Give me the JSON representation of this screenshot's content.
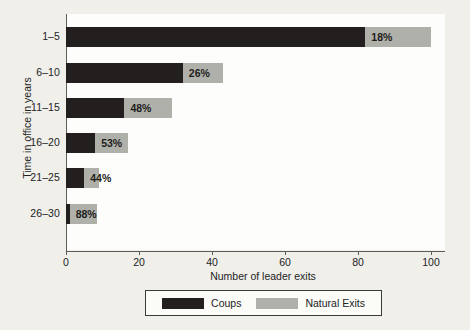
{
  "chart_data": {
    "type": "bar",
    "orientation": "horizontal",
    "stacked": true,
    "title": "",
    "xlabel": "Number of leader exits",
    "ylabel": "Time in office in years",
    "categories": [
      "1–5",
      "6–10",
      "11–15",
      "16–20",
      "21–25",
      "26–30"
    ],
    "series": [
      {
        "name": "Coups",
        "color": "#221f1e",
        "values": [
          82,
          32,
          16,
          8,
          5,
          1
        ]
      },
      {
        "name": "Natural Exits",
        "color": "#b0b0ab",
        "values": [
          18,
          11,
          13,
          9,
          4,
          7.5
        ]
      }
    ],
    "totals": [
      100,
      43,
      29,
      17,
      9,
      8.5
    ],
    "data_labels": [
      "18%",
      "26%",
      "48%",
      "53%",
      "44%",
      "88%"
    ],
    "data_label_meaning": "Share of exits that were natural exits",
    "xlim": [
      0,
      105
    ],
    "xticks": [
      0,
      20,
      40,
      60,
      80,
      100
    ],
    "xtick_labels": [
      "0",
      "20",
      "40",
      "60",
      "80",
      "100"
    ],
    "grid": false,
    "legend_position": "bottom",
    "legend_entries": [
      "Coups",
      "Natural Exits"
    ]
  },
  "axis": {
    "y_title": "Time in office in years",
    "x_title": "Number of leader exits"
  },
  "colors": {
    "coups": "#221f1e",
    "natural": "#b0b0ab",
    "page_background": "#f0efe9",
    "panel_background": "#fdfdfb",
    "axis": "#5d5d58",
    "text": "#23231f"
  }
}
